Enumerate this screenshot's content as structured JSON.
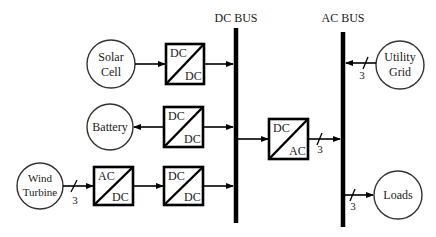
{
  "diagram": {
    "buses": {
      "dc": {
        "label": "DC BUS"
      },
      "ac": {
        "label": "AC BUS"
      }
    },
    "sources": {
      "solar": {
        "line1": "Solar",
        "line2": "Cell"
      },
      "battery": {
        "label": "Battery"
      },
      "wind": {
        "line1": "Wind",
        "line2": "Turbine"
      },
      "utility": {
        "line1": "Utility",
        "line2": "Grid"
      },
      "loads": {
        "label": "Loads"
      }
    },
    "converters": {
      "solar_dcdc": {
        "top": "DC",
        "bottom": "DC"
      },
      "battery_dcdc": {
        "top": "DC",
        "bottom": "DC"
      },
      "wind_acdc": {
        "top": "AC",
        "bottom": "DC"
      },
      "wind_dcdc": {
        "top": "DC",
        "bottom": "DC"
      },
      "inverter_dcac": {
        "top": "DC",
        "bottom": "AC"
      }
    },
    "phase_counts": {
      "wind": "3",
      "inverter": "3",
      "utility": "3",
      "loads": "3"
    },
    "colors": {
      "line": "#000000",
      "background": "#ffffff"
    }
  }
}
